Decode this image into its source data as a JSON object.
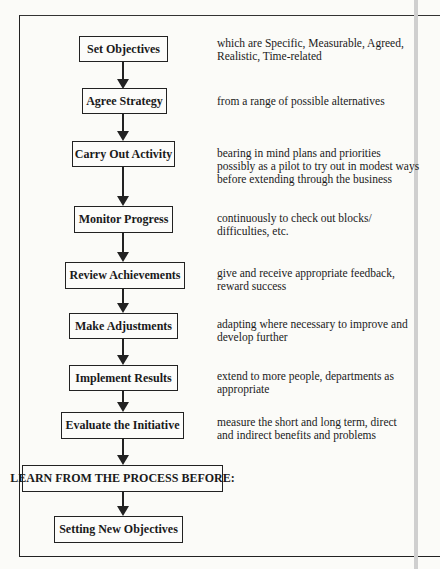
{
  "diagram": {
    "type": "flowchart",
    "steps": [
      {
        "label": "Set Objectives",
        "description": "which are Specific, Measurable, Agreed,\nRealistic, Time-related"
      },
      {
        "label": "Agree Strategy",
        "description": "from a range of possible alternatives"
      },
      {
        "label": "Carry Out Activity",
        "description": "bearing in mind plans and priorities\npossibly as a pilot to try out in modest ways\nbefore extending through the business"
      },
      {
        "label": "Monitor Progress",
        "description": "continuously to check out blocks/\ndifficulties, etc."
      },
      {
        "label": "Review Achievements",
        "description": "give and receive appropriate feedback,\nreward success"
      },
      {
        "label": "Make Adjustments",
        "description": "adapting where necessary to improve and\ndevelop further"
      },
      {
        "label": "Implement Results",
        "description": "extend to more people, departments as\nappropriate"
      },
      {
        "label": "Evaluate the Initiative",
        "description": "measure the short and long term, direct\nand indirect benefits and problems"
      },
      {
        "label": "LEARN FROM THE PROCESS BEFORE:",
        "description": ""
      },
      {
        "label": "Setting New Objectives",
        "description": ""
      }
    ]
  }
}
